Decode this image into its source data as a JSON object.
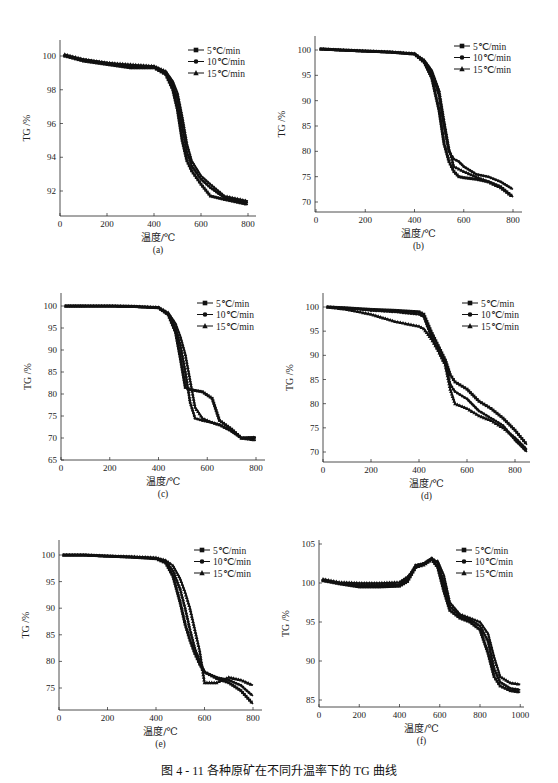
{
  "figure": {
    "caption": "图 4 - 11   各种原矿在不同升温率下的 TG 曲线"
  },
  "legend": [
    "5℃/min",
    "10℃/min",
    "15℃/min"
  ],
  "colors": {
    "line": "#111111",
    "axis": "#222222"
  },
  "chart_data": [
    {
      "id": "a",
      "type": "line",
      "label": "(a)",
      "xlabel": "温度/℃",
      "ylabel": "TG /%",
      "xlim": [
        0,
        830
      ],
      "ylim": [
        90.5,
        101
      ],
      "xticks": [
        0,
        200,
        400,
        600,
        800
      ],
      "yticks": [
        92,
        94,
        96,
        98,
        100
      ],
      "legend_position": "upper right",
      "box": {
        "x0": 60,
        "x1": 256,
        "y0": 40,
        "y1": 216,
        "xpx0": 60,
        "xpx800": 248,
        "ypxA": 56,
        "yvA": 100,
        "ypxB": 191,
        "yvB": 92
      },
      "x": [
        20,
        100,
        200,
        300,
        400,
        450,
        480,
        500,
        520,
        540,
        560,
        600,
        640,
        700,
        800
      ],
      "series": [
        {
          "name": "5℃/min",
          "marker": "square",
          "values": [
            100.0,
            99.7,
            99.5,
            99.3,
            99.3,
            98.9,
            98.0,
            96.8,
            95.0,
            93.8,
            93.2,
            92.4,
            91.7,
            91.5,
            91.2
          ]
        },
        {
          "name": "10℃/min",
          "marker": "circle",
          "values": [
            100.0,
            99.8,
            99.6,
            99.4,
            99.4,
            99.0,
            98.3,
            97.4,
            95.8,
            94.3,
            93.5,
            92.7,
            92.2,
            91.6,
            91.3
          ]
        },
        {
          "name": "15℃/min",
          "marker": "triangle",
          "values": [
            100.1,
            99.8,
            99.6,
            99.5,
            99.4,
            99.1,
            98.5,
            97.8,
            96.4,
            94.8,
            93.8,
            92.9,
            92.4,
            91.7,
            91.4
          ]
        }
      ]
    },
    {
      "id": "b",
      "type": "line",
      "label": "(b)",
      "xlabel": "温度/℃",
      "ylabel": "TG /%",
      "xlim": [
        0,
        830
      ],
      "ylim": [
        68,
        103
      ],
      "xticks": [
        0,
        200,
        400,
        600,
        800
      ],
      "yticks": [
        70,
        75,
        80,
        85,
        90,
        95,
        100
      ],
      "legend_position": "upper right",
      "box": {
        "x0": 315,
        "x1": 522,
        "y0": 36,
        "y1": 212,
        "xpx0": 316,
        "xpx800": 513,
        "ypxA": 50,
        "yvA": 100,
        "ypxB": 202,
        "yvB": 70
      },
      "x": [
        20,
        100,
        200,
        300,
        400,
        440,
        470,
        500,
        520,
        540,
        560,
        580,
        600,
        650,
        700,
        750,
        800
      ],
      "series": [
        {
          "name": "5℃/min",
          "marker": "square",
          "values": [
            100.2,
            100.0,
            99.8,
            99.6,
            99.2,
            97.5,
            94.5,
            88.0,
            81.5,
            78.0,
            76.0,
            75.0,
            74.8,
            74.5,
            74.0,
            73.0,
            71.0
          ]
        },
        {
          "name": "10℃/min",
          "marker": "circle",
          "values": [
            100.2,
            100.0,
            99.8,
            99.6,
            99.2,
            97.8,
            95.5,
            91.0,
            85.0,
            80.0,
            78.5,
            78.0,
            77.0,
            75.5,
            75.0,
            74.0,
            72.5
          ]
        },
        {
          "name": "15℃/min",
          "marker": "triangle",
          "values": [
            100.2,
            100.0,
            99.8,
            99.6,
            99.3,
            98.0,
            96.0,
            92.0,
            86.0,
            80.5,
            77.0,
            76.5,
            76.0,
            75.0,
            74.0,
            72.8,
            71.0
          ]
        }
      ]
    },
    {
      "id": "c",
      "type": "line",
      "label": "(c)",
      "xlabel": "温度/℃",
      "ylabel": "TG /%",
      "xlim": [
        0,
        830
      ],
      "ylim": [
        65,
        103
      ],
      "xticks": [
        0,
        200,
        400,
        600,
        800
      ],
      "yticks": [
        65,
        70,
        75,
        80,
        85,
        90,
        95,
        100
      ],
      "legend_position": "upper right",
      "box": {
        "x0": 61,
        "x1": 265,
        "y0": 293,
        "y1": 460,
        "xpx0": 61,
        "xpx800": 256,
        "ypxA": 306,
        "yvA": 100,
        "ypxB": 438,
        "yvB": 70
      },
      "x": [
        20,
        100,
        200,
        300,
        400,
        440,
        470,
        490,
        510,
        530,
        550,
        580,
        620,
        650,
        700,
        740,
        800
      ],
      "series": [
        {
          "name": "5℃/min",
          "marker": "square",
          "values": [
            100.0,
            100.0,
            100.0,
            99.9,
            99.6,
            98.0,
            94.0,
            88.0,
            81.5,
            81.0,
            80.8,
            80.5,
            79.0,
            74.0,
            72.0,
            70.0,
            70.0
          ]
        },
        {
          "name": "10℃/min",
          "marker": "circle",
          "values": [
            100.0,
            100.0,
            100.0,
            99.9,
            99.6,
            98.2,
            95.0,
            91.0,
            85.0,
            78.0,
            74.5,
            74.0,
            73.5,
            73.0,
            71.5,
            70.0,
            70.2
          ]
        },
        {
          "name": "15℃/min",
          "marker": "triangle",
          "values": [
            100.0,
            100.0,
            100.0,
            99.9,
            99.7,
            98.5,
            96.0,
            93.0,
            89.0,
            83.0,
            77.0,
            74.5,
            73.5,
            73.0,
            71.8,
            70.0,
            69.5
          ]
        }
      ]
    },
    {
      "id": "d",
      "type": "line",
      "label": "(d)",
      "xlabel": "温度/℃",
      "ylabel": "TG /%",
      "xlim": [
        0,
        850
      ],
      "ylim": [
        68.5,
        103
      ],
      "xticks": [
        0,
        200,
        400,
        600,
        800
      ],
      "yticks": [
        70,
        75,
        80,
        85,
        90,
        95,
        100
      ],
      "legend_position": "upper right",
      "box": {
        "x0": 323,
        "x1": 530,
        "y0": 293,
        "y1": 462,
        "xpx0": 323,
        "xpx800": 515,
        "ypxA": 307,
        "yvA": 100,
        "ypxB": 452,
        "yvB": 70
      },
      "x": [
        20,
        100,
        200,
        300,
        400,
        420,
        450,
        480,
        510,
        530,
        550,
        600,
        650,
        700,
        750,
        800,
        850
      ],
      "series": [
        {
          "name": "5℃/min",
          "marker": "square",
          "values": [
            100.0,
            99.8,
            99.5,
            99.3,
            99.0,
            98.5,
            95.0,
            92.0,
            89.0,
            86.0,
            84.5,
            83.0,
            80.5,
            79.0,
            77.0,
            74.5,
            71.5
          ]
        },
        {
          "name": "10℃/min",
          "marker": "circle",
          "values": [
            100.0,
            99.8,
            99.3,
            99.0,
            98.5,
            98.0,
            94.0,
            91.0,
            88.0,
            84.0,
            82.5,
            81.0,
            78.5,
            77.0,
            75.5,
            72.5,
            70.0
          ]
        },
        {
          "name": "15℃/min",
          "marker": "triangle",
          "values": [
            100.0,
            99.5,
            98.5,
            97.0,
            96.0,
            95.5,
            93.5,
            91.0,
            88.0,
            83.0,
            80.0,
            79.0,
            77.5,
            76.5,
            75.0,
            73.0,
            70.5
          ]
        }
      ]
    },
    {
      "id": "e",
      "type": "line",
      "label": "(e)",
      "xlabel": "温度/℃",
      "ylabel": "TG /%",
      "xlim": [
        0,
        830
      ],
      "ylim": [
        71,
        103
      ],
      "xticks": [
        0,
        200,
        400,
        600,
        800
      ],
      "yticks": [
        75,
        80,
        85,
        90,
        95,
        100
      ],
      "legend_position": "upper right",
      "box": {
        "x0": 59,
        "x1": 262,
        "y0": 540,
        "y1": 710,
        "xpx0": 59,
        "xpx800": 253,
        "ypxA": 555,
        "yvA": 100,
        "ypxB": 688,
        "yvB": 75
      },
      "x": [
        20,
        100,
        200,
        300,
        400,
        440,
        470,
        500,
        520,
        540,
        560,
        580,
        600,
        650,
        700,
        750,
        800
      ],
      "series": [
        {
          "name": "5℃/min",
          "marker": "square",
          "values": [
            100.0,
            100.0,
            99.8,
            99.6,
            99.3,
            98.5,
            96.0,
            91.0,
            87.0,
            84.0,
            81.5,
            79.5,
            78.0,
            76.8,
            76.0,
            74.5,
            72.0
          ]
        },
        {
          "name": "10℃/min",
          "marker": "circle",
          "values": [
            100.0,
            100.0,
            99.8,
            99.6,
            99.4,
            98.8,
            97.0,
            93.5,
            90.0,
            86.0,
            82.5,
            80.0,
            78.0,
            77.0,
            76.5,
            75.5,
            73.5
          ]
        },
        {
          "name": "15℃/min",
          "marker": "triangle",
          "values": [
            100.0,
            100.0,
            99.8,
            99.7,
            99.5,
            99.0,
            98.0,
            95.5,
            93.0,
            90.0,
            86.0,
            82.0,
            76.0,
            76.0,
            77.0,
            76.5,
            75.5
          ]
        }
      ]
    },
    {
      "id": "f",
      "type": "line",
      "label": "(f)",
      "xlabel": "温度/℃",
      "ylabel": "TG /%",
      "xlim": [
        0,
        1000
      ],
      "ylim": [
        84.5,
        105.5
      ],
      "xticks": [
        0,
        200,
        400,
        600,
        800,
        1000
      ],
      "yticks": [
        85,
        90,
        95,
        100,
        105
      ],
      "legend_position": "upper right",
      "box": {
        "x0": 319,
        "x1": 524,
        "y0": 540,
        "y1": 707,
        "xpx0": 319,
        "xpx800": 480,
        "ypxA": 583,
        "yvA": 100,
        "ypxB": 700,
        "yvB": 85
      },
      "x": [
        20,
        100,
        200,
        300,
        400,
        440,
        480,
        520,
        560,
        590,
        620,
        650,
        700,
        750,
        800,
        840,
        870,
        900,
        950,
        1000
      ],
      "series": [
        {
          "name": "5℃/min",
          "marker": "square",
          "values": [
            100.3,
            99.9,
            99.5,
            99.5,
            99.6,
            100.2,
            102.0,
            102.5,
            103.0,
            102.0,
            99.0,
            96.5,
            95.5,
            95.0,
            94.0,
            91.0,
            88.0,
            86.8,
            86.2,
            86.0
          ]
        },
        {
          "name": "10℃/min",
          "marker": "circle",
          "values": [
            100.3,
            100.0,
            99.7,
            99.7,
            99.8,
            100.5,
            102.3,
            102.5,
            103.2,
            102.5,
            100.0,
            97.0,
            95.8,
            95.3,
            94.5,
            92.5,
            89.0,
            87.3,
            86.5,
            86.3
          ]
        },
        {
          "name": "15℃/min",
          "marker": "triangle",
          "values": [
            100.5,
            100.1,
            100.0,
            100.0,
            100.1,
            100.8,
            102.0,
            102.3,
            103.0,
            102.8,
            101.0,
            97.5,
            96.0,
            95.5,
            95.0,
            93.5,
            90.5,
            88.0,
            87.2,
            87.0
          ]
        }
      ]
    }
  ]
}
